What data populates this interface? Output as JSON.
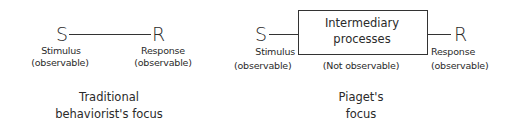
{
  "left_diagram": {
    "stimulus_symbol": "S",
    "response_symbol": "R",
    "stimulus_label": "Stimulus",
    "stimulus_sublabel": "(observable)",
    "response_label": "Response",
    "response_sublabel": "(observable)",
    "caption_line1": "Traditional",
    "caption_line2": "behaviorist's focus"
  },
  "right_diagram": {
    "stimulus_symbol": "S",
    "response_symbol": "R",
    "box_line1": "Intermediary",
    "box_line2": "processes",
    "box_sublabel": "(Not observable)",
    "stimulus_label": "Stimulus",
    "stimulus_sublabel": "(observable)",
    "response_label": "Response",
    "response_sublabel": "(observable)",
    "caption_line1": "Piaget's",
    "caption_line2": "focus"
  }
}
